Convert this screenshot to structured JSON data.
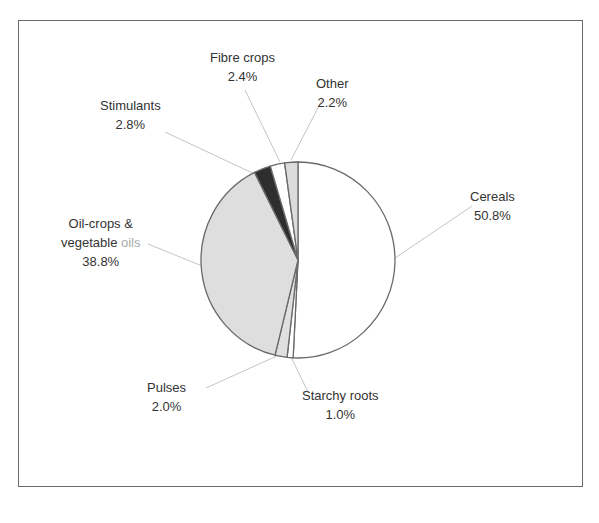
{
  "chart_data": {
    "type": "pie",
    "title": "",
    "slices": [
      {
        "label": "Cereals",
        "value": 50.8,
        "display": "50.8%",
        "fill": "#ffffff"
      },
      {
        "label": "Starchy roots",
        "value": 1.0,
        "display": "1.0%",
        "fill": "#ffffff"
      },
      {
        "label": "Pulses",
        "value": 2.0,
        "display": "2.0%",
        "fill": "#e0e0e0"
      },
      {
        "label": "Oil-crops & vegetable oils",
        "value": 38.8,
        "display": "38.8%",
        "fill": "#dedede"
      },
      {
        "label": "Stimulants",
        "value": 2.8,
        "display": "2.8%",
        "fill": "#2e2e2e"
      },
      {
        "label": "Fibre crops",
        "value": 2.4,
        "display": "2.4%",
        "fill": "#ffffff"
      },
      {
        "label": "Other",
        "value": 2.2,
        "display": "2.2%",
        "fill": "#dcdcdc"
      }
    ],
    "start_angle": "12 o'clock, clockwise",
    "legend": "none (leader-line labels)"
  },
  "labels": {
    "cereals": {
      "name": "Cereals",
      "pct": "50.8%"
    },
    "starchy": {
      "name": "Starchy roots",
      "pct": "1.0%"
    },
    "pulses": {
      "name": "Pulses",
      "pct": "2.0%"
    },
    "oil": {
      "line1": "Oil-crops &",
      "line2a": "vegetable ",
      "line2b": "oils",
      "pct": "38.8%"
    },
    "stimulants": {
      "name": "Stimulants",
      "pct": "2.8%"
    },
    "fibre": {
      "name": "Fibre crops",
      "pct": "2.4%"
    },
    "other": {
      "name": "Other",
      "pct": "2.2%"
    }
  }
}
